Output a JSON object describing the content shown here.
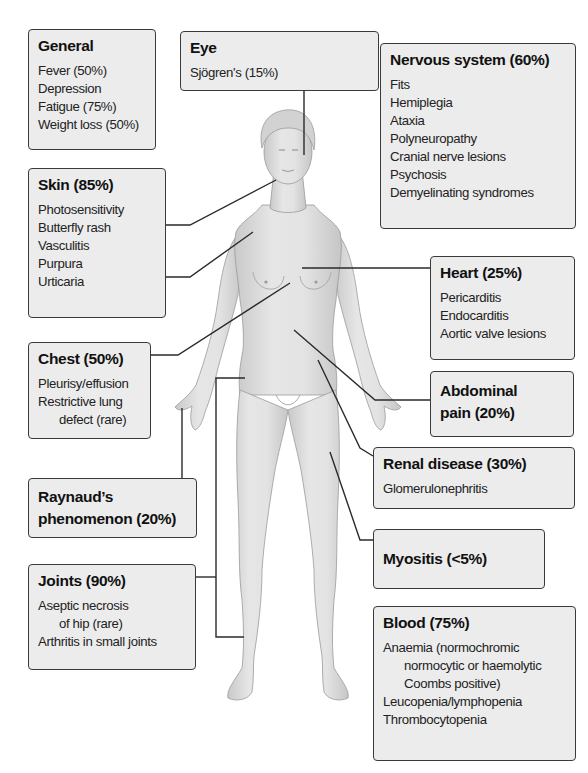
{
  "diagram": {
    "colors": {
      "box_fill": "#ececec",
      "box_border": "#3a3a3a",
      "line": "#2a2a2a",
      "skin": "#d9d9d9"
    },
    "boxes": {
      "general": {
        "title": "General",
        "items": [
          "Fever (50%)",
          "Depression",
          "Fatigue (75%)",
          "Weight loss (50%)"
        ]
      },
      "eye": {
        "title": "Eye",
        "items": [
          "Sjögren's (15%)"
        ]
      },
      "nervous": {
        "title": "Nervous system (60%)",
        "items": [
          "Fits",
          "Hemiplegia",
          "Ataxia",
          "Polyneuropathy",
          "Cranial nerve lesions",
          "Psychosis",
          "Demyelinating syndromes"
        ]
      },
      "skin": {
        "title": "Skin (85%)",
        "items": [
          "Photosensitivity",
          "Butterfly rash",
          "Vasculitis",
          "Purpura",
          "Urticaria"
        ]
      },
      "heart": {
        "title": "Heart (25%)",
        "items": [
          "Pericarditis",
          "Endocarditis",
          "Aortic valve lesions"
        ]
      },
      "chest": {
        "title": "Chest (50%)",
        "items": [
          "Pleurisy/effusion",
          "Restrictive lung",
          "defect (rare)"
        ]
      },
      "abdominal": {
        "title_line1": "Abdominal",
        "title_line2": "pain (20%)"
      },
      "renal": {
        "title": "Renal disease (30%)",
        "items": [
          "Glomerulonephritis"
        ]
      },
      "raynauds": {
        "title_line1": "Raynaud’s",
        "title_line2": "phenomenon (20%)"
      },
      "myositis": {
        "title": "Myositis (<5%)"
      },
      "joints": {
        "title": "Joints (90%)",
        "items": [
          "Aseptic necrosis",
          "of hip (rare)",
          "Arthritis in small joints"
        ]
      },
      "blood": {
        "title": "Blood (75%)",
        "items": [
          "Anaemia (normochromic",
          "normocytic or haemolytic",
          "Coombs positive)",
          "Leucopenia/lymphopenia",
          "Thrombocytopenia"
        ]
      }
    }
  }
}
